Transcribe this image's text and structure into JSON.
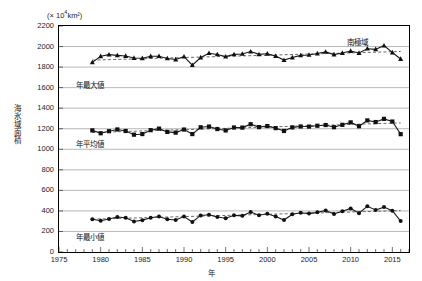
{
  "chart_data": {
    "type": "line",
    "title": "",
    "region_label": "南極域",
    "unit_label": "(× 10⁴km²)",
    "unit_prefix": "(× 10",
    "unit_exp": "4",
    "unit_suffix": "km²)",
    "xlabel": "年",
    "ylabel": "海氷域面積",
    "grid": true,
    "legend_position": "inline-left",
    "xlim": [
      1975,
      2017
    ],
    "ylim": [
      0,
      2200
    ],
    "ytick_step": 200,
    "yticks": [
      0,
      200,
      400,
      600,
      800,
      1000,
      1200,
      1400,
      1600,
      1800,
      2000,
      2200
    ],
    "xticks": [
      1975,
      1980,
      1985,
      1990,
      1995,
      2000,
      2005,
      2010,
      2015
    ],
    "xtick_minor_step": 1,
    "x": [
      1979,
      1980,
      1981,
      1982,
      1983,
      1984,
      1985,
      1986,
      1987,
      1988,
      1989,
      1990,
      1991,
      1992,
      1993,
      1994,
      1995,
      1996,
      1997,
      1998,
      1999,
      2000,
      2001,
      2002,
      2003,
      2004,
      2005,
      2006,
      2007,
      2008,
      2009,
      2010,
      2011,
      2012,
      2013,
      2014,
      2015,
      2016
    ],
    "series": [
      {
        "name": "年最大値",
        "marker": "triangle",
        "values": [
          1846,
          1905,
          1921,
          1914,
          1908,
          1888,
          1886,
          1905,
          1906,
          1884,
          1874,
          1902,
          1819,
          1893,
          1935,
          1923,
          1902,
          1924,
          1928,
          1951,
          1924,
          1930,
          1907,
          1868,
          1893,
          1914,
          1918,
          1932,
          1948,
          1922,
          1937,
          1956,
          1937,
          1979,
          1973,
          2009,
          1942,
          1879
        ],
        "trend_start": 1868,
        "trend_end": 1952
      },
      {
        "name": "年平均値",
        "marker": "square",
        "values": [
          1184,
          1156,
          1176,
          1193,
          1178,
          1142,
          1148,
          1186,
          1201,
          1169,
          1162,
          1192,
          1148,
          1214,
          1221,
          1197,
          1183,
          1212,
          1211,
          1244,
          1216,
          1226,
          1206,
          1178,
          1213,
          1222,
          1221,
          1229,
          1236,
          1215,
          1238,
          1262,
          1224,
          1281,
          1265,
          1296,
          1270,
          1147
        ],
        "trend_start": 1163,
        "trend_end": 1257
      },
      {
        "name": "年最小値",
        "marker": "circle",
        "values": [
          318,
          304,
          322,
          340,
          333,
          297,
          310,
          334,
          345,
          318,
          311,
          345,
          292,
          356,
          362,
          340,
          329,
          357,
          352,
          389,
          358,
          372,
          346,
          311,
          368,
          382,
          374,
          386,
          404,
          370,
          397,
          424,
          378,
          445,
          409,
          437,
          402,
          301
        ],
        "trend_start": 320,
        "trend_end": 403
      }
    ]
  }
}
